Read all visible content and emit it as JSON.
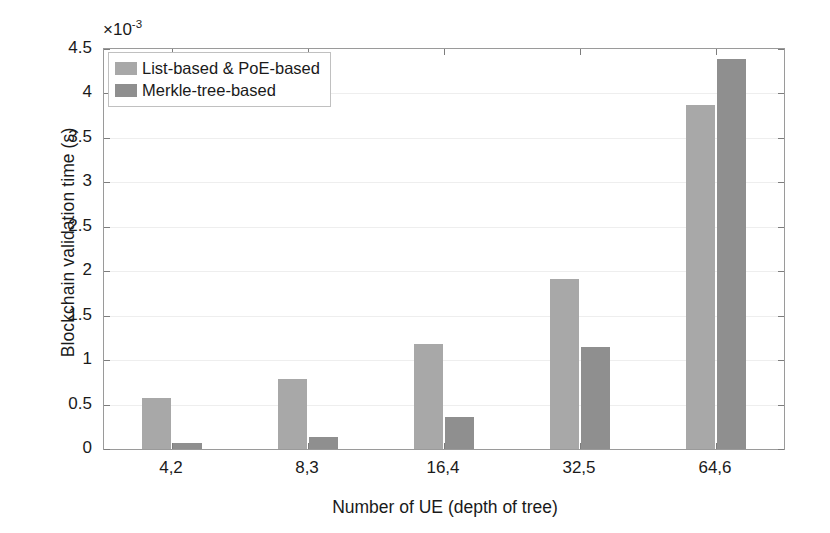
{
  "chart_data": {
    "type": "bar",
    "title": "",
    "xlabel": "Number of UE (depth of tree)",
    "ylabel": "Blockchain validation time (s)",
    "y_exponent_label": "×10",
    "y_exponent_power": "-3",
    "y_scale_factor": 0.001,
    "categories": [
      "4,2",
      "8,3",
      "16,4",
      "32,5",
      "64,6"
    ],
    "series": [
      {
        "name": "List-based & PoE-based",
        "color": "#a8a8a8",
        "values": [
          0.57,
          0.79,
          1.18,
          1.91,
          3.87
        ]
      },
      {
        "name": "Merkle-tree-based",
        "color": "#8f8f8f",
        "values": [
          0.07,
          0.14,
          0.36,
          1.15,
          4.39
        ]
      }
    ],
    "ylim": [
      0,
      4.5
    ],
    "yticks": [
      0,
      0.5,
      1,
      1.5,
      2,
      2.5,
      3,
      3.5,
      4,
      4.5
    ],
    "ytick_labels": [
      "0",
      "0.5",
      "1",
      "1.5",
      "2",
      "2.5",
      "3",
      "3.5",
      "4",
      "4.5"
    ],
    "grid": true,
    "legend_position": "top-left",
    "axis_color": "#9a9a9a",
    "grid_color": "#eeeeee",
    "background": "#ffffff"
  }
}
